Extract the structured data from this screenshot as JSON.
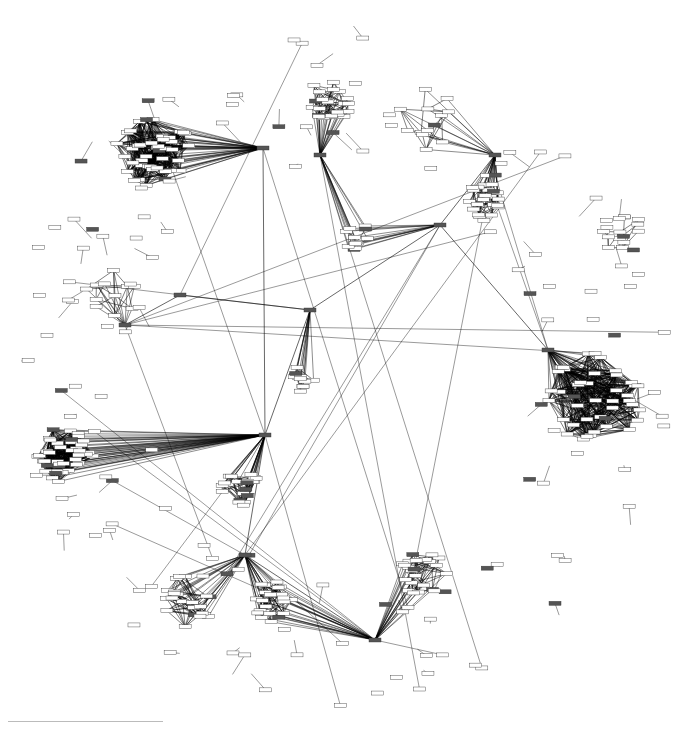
{
  "diagram": {
    "type": "network",
    "edge_color": "#000000",
    "node_fill": "#ffffff",
    "node_dark_fill": "#555555",
    "label_legibility": "unreadable at screenshot resolution",
    "clusters": [
      {
        "id": "c1",
        "cx": 150,
        "cy": 150,
        "r": 40,
        "density": "very-dense"
      },
      {
        "id": "c2",
        "cx": 330,
        "cy": 100,
        "r": 22,
        "density": "dense"
      },
      {
        "id": "c3",
        "cx": 480,
        "cy": 200,
        "r": 20,
        "density": "dense"
      },
      {
        "id": "c4",
        "cx": 595,
        "cy": 400,
        "r": 48,
        "density": "very-dense"
      },
      {
        "id": "c5",
        "cx": 65,
        "cy": 455,
        "r": 28,
        "density": "very-dense"
      },
      {
        "id": "c6",
        "cx": 240,
        "cy": 490,
        "r": 20,
        "density": "dense"
      },
      {
        "id": "c7",
        "cx": 425,
        "cy": 575,
        "r": 25,
        "density": "dense"
      },
      {
        "id": "c8",
        "cx": 270,
        "cy": 600,
        "r": 22,
        "density": "dense"
      },
      {
        "id": "c9",
        "cx": 300,
        "cy": 380,
        "r": 14,
        "density": "medium"
      },
      {
        "id": "c10",
        "cx": 355,
        "cy": 238,
        "r": 16,
        "density": "medium"
      },
      {
        "id": "c11",
        "cx": 110,
        "cy": 290,
        "r": 30,
        "density": "medium"
      },
      {
        "id": "c12",
        "cx": 190,
        "cy": 600,
        "r": 28,
        "density": "dense"
      },
      {
        "id": "c13",
        "cx": 620,
        "cy": 230,
        "r": 22,
        "density": "medium"
      },
      {
        "id": "c14",
        "cx": 430,
        "cy": 120,
        "r": 35,
        "density": "medium"
      }
    ],
    "hubs": [
      {
        "id": "h1",
        "x": 548,
        "y": 350
      },
      {
        "id": "h2",
        "x": 265,
        "y": 435
      },
      {
        "id": "h3",
        "x": 245,
        "y": 555
      },
      {
        "id": "h4",
        "x": 320,
        "y": 155
      },
      {
        "id": "h5",
        "x": 495,
        "y": 155
      },
      {
        "id": "h6",
        "x": 263,
        "y": 148
      },
      {
        "id": "h7",
        "x": 375,
        "y": 640
      },
      {
        "id": "h8",
        "x": 125,
        "y": 325
      },
      {
        "id": "h9",
        "x": 180,
        "y": 295
      },
      {
        "id": "h10",
        "x": 440,
        "y": 225
      },
      {
        "id": "h11",
        "x": 310,
        "y": 310
      }
    ],
    "hub_links": [
      [
        "h1",
        "c4"
      ],
      [
        "h1",
        "h10"
      ],
      [
        "h2",
        "h11"
      ],
      [
        "h2",
        "c6"
      ],
      [
        "h3",
        "c8"
      ],
      [
        "h3",
        "c12"
      ],
      [
        "h4",
        "c2"
      ],
      [
        "h4",
        "c10"
      ],
      [
        "h5",
        "c3"
      ],
      [
        "h5",
        "c14"
      ],
      [
        "h6",
        "h2"
      ],
      [
        "h6",
        "c1"
      ],
      [
        "h7",
        "c7"
      ],
      [
        "h7",
        "c8"
      ],
      [
        "h8",
        "c11"
      ],
      [
        "h9",
        "h8"
      ],
      [
        "h9",
        "h11"
      ],
      [
        "h10",
        "c10"
      ],
      [
        "h11",
        "c9"
      ],
      [
        "h2",
        "c5"
      ],
      [
        "h2",
        "h3"
      ],
      [
        "h10",
        "h5"
      ],
      [
        "h11",
        "h10"
      ],
      [
        "h3",
        "h7"
      ]
    ]
  }
}
